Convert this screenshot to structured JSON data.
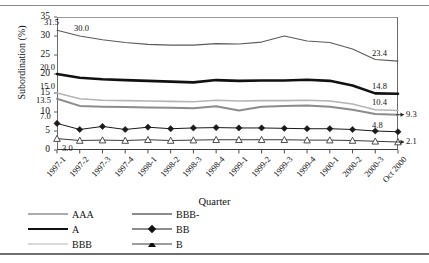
{
  "chart_data": {
    "type": "line",
    "title": "",
    "xlabel": "Quarter",
    "ylabel": "Subordination (%)",
    "ylim": [
      0,
      35
    ],
    "yticks": [
      0,
      5,
      10,
      15,
      20,
      25,
      30,
      35
    ],
    "grid": false,
    "legend_position": "bottom-left",
    "categories": [
      "1997-1",
      "1997-2",
      "1997-3",
      "1997-4",
      "1998-1",
      "1998-2",
      "1998-3",
      "1998-4",
      "1999-1",
      "1999-2",
      "1999-3",
      "1999-4",
      "1900-1",
      "2000-2",
      "2000-3",
      "Oct 2000"
    ],
    "series": [
      {
        "name": "AAA",
        "color": "#5a5a5a",
        "width": 1.1,
        "marker": "none",
        "values": [
          31.5,
          30.0,
          29.0,
          28.3,
          27.8,
          27.6,
          27.6,
          28.0,
          27.9,
          28.4,
          30.0,
          28.7,
          28.3,
          26.6,
          23.8,
          23.4
        ]
      },
      {
        "name": "A",
        "color": "#111111",
        "width": 2.6,
        "marker": "none",
        "values": [
          20.0,
          19.0,
          18.6,
          18.4,
          18.2,
          18.0,
          17.8,
          18.4,
          18.2,
          18.3,
          18.3,
          18.5,
          18.2,
          17.0,
          14.9,
          14.8
        ]
      },
      {
        "name": "BBB",
        "color": "#b4b4b4",
        "width": 1.6,
        "marker": "none",
        "values": [
          15.0,
          13.5,
          13.1,
          13.0,
          12.9,
          12.8,
          12.7,
          13.1,
          12.9,
          13.0,
          13.0,
          13.1,
          12.9,
          12.1,
          10.6,
          10.4
        ]
      },
      {
        "name": "BBB-",
        "color": "#8c8c8c",
        "width": 2.0,
        "marker": "none",
        "values": [
          13.5,
          11.6,
          11.4,
          11.3,
          11.2,
          11.1,
          11.0,
          11.5,
          10.4,
          11.4,
          11.6,
          11.7,
          11.4,
          10.6,
          9.5,
          9.3
        ]
      },
      {
        "name": "BB",
        "color": "#1a1a1a",
        "width": 1.0,
        "marker": "diamond",
        "values": [
          7.0,
          5.4,
          6.2,
          5.4,
          6.0,
          5.6,
          5.8,
          5.9,
          5.8,
          5.8,
          5.7,
          5.6,
          5.6,
          5.4,
          5.0,
          4.8
        ]
      },
      {
        "name": "B",
        "color": "#3a3a3a",
        "width": 1.0,
        "marker": "triangle",
        "values": [
          3.0,
          2.5,
          2.6,
          2.5,
          2.7,
          2.5,
          2.6,
          2.7,
          2.7,
          2.7,
          2.7,
          2.6,
          2.6,
          2.5,
          2.3,
          2.1
        ]
      }
    ],
    "start_labels": [
      {
        "text": "31.5",
        "series": "AAA"
      },
      {
        "text": "30.0",
        "series": "AAA"
      },
      {
        "text": "20.0",
        "series": "A"
      },
      {
        "text": "15.0",
        "series": "BBB"
      },
      {
        "text": "13.5",
        "series": "BBB-"
      },
      {
        "text": "7.0",
        "series": "BB"
      },
      {
        "text": "3.0",
        "series": "B"
      }
    ],
    "end_labels": [
      {
        "text": "23.4",
        "series": "AAA"
      },
      {
        "text": "14.8",
        "series": "A"
      },
      {
        "text": "10.4",
        "series": "BBB"
      },
      {
        "text": "9.3",
        "series": "BBB-"
      },
      {
        "text": "4.8",
        "series": "BB"
      },
      {
        "text": "2.1",
        "series": "B"
      }
    ]
  },
  "axis": {
    "y_title": "Subordination (%)",
    "x_title": "Quarter",
    "yticks": [
      "0",
      "5",
      "10",
      "15",
      "20",
      "25",
      "30",
      "35"
    ]
  },
  "legend": {
    "items": [
      {
        "label": "AAA",
        "col": 0,
        "row": 0
      },
      {
        "label": "A",
        "col": 0,
        "row": 1
      },
      {
        "label": "BBB",
        "col": 0,
        "row": 2
      },
      {
        "label": "BBB-",
        "col": 1,
        "row": 0
      },
      {
        "label": "BB",
        "col": 1,
        "row": 1
      },
      {
        "label": "B",
        "col": 1,
        "row": 2
      }
    ]
  }
}
